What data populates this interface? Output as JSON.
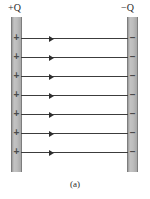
{
  "figure": {
    "caption": "(a)",
    "type": "parallel-plate-capacitor-field-diagram",
    "background_color": "#ffffff"
  },
  "labels": {
    "positive_plate": {
      "sign": "+",
      "symbol": "Q",
      "full": "+Q"
    },
    "negative_plate": {
      "sign": "−",
      "symbol": "Q",
      "full": "−Q"
    }
  },
  "plates": {
    "fill_color": "#bdbdbd",
    "edge_color": "#7d7d7d",
    "left": {
      "charge": "positive",
      "sign_glyph": "+",
      "sign_count": 7,
      "sign_positions_y": [
        33,
        52,
        71,
        90,
        109,
        128,
        147
      ]
    },
    "right": {
      "charge": "negative",
      "sign_glyph": "–",
      "sign_count": 7,
      "sign_positions_y": [
        33,
        52,
        71,
        90,
        109,
        128,
        147
      ]
    }
  },
  "field": {
    "line_color": "#3c3c3c",
    "arrow_direction": "right",
    "line_count": 7,
    "line_positions_y": [
      38,
      57,
      76,
      95,
      114,
      133,
      152
    ]
  }
}
